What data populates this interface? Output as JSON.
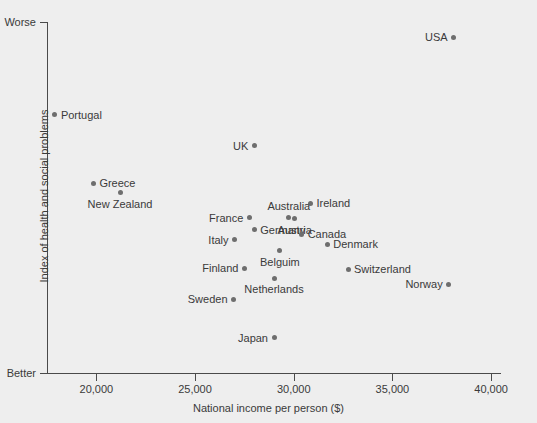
{
  "chart_data": {
    "type": "scatter",
    "title": "",
    "xlabel": "National income per person ($)",
    "ylabel": "Index of health and social problems",
    "xlim": [
      17500,
      40500
    ],
    "ylim": [
      0,
      100
    ],
    "grid": false,
    "legend": "none",
    "y_axis_endpoints": {
      "top": "Worse",
      "bottom": "Better"
    },
    "x_ticks": [
      {
        "label": "20,000",
        "value": 20000
      },
      {
        "label": "25,000",
        "value": 25000
      },
      {
        "label": "30,000",
        "value": 30000
      },
      {
        "label": "35,000",
        "value": 35000
      },
      {
        "label": "40,000",
        "value": 40000
      }
    ],
    "points": [
      {
        "name": "USA",
        "x": 38100,
        "y": 95.6,
        "label_pos": "left"
      },
      {
        "name": "Portugal",
        "x": 17900,
        "y": 73.6,
        "label_pos": "right"
      },
      {
        "name": "UK",
        "x": 28000,
        "y": 64.8,
        "label_pos": "left"
      },
      {
        "name": "Greece",
        "x": 19850,
        "y": 54.1,
        "label_pos": "right"
      },
      {
        "name": "New Zealand",
        "x": 21200,
        "y": 51.3,
        "label_pos": "below"
      },
      {
        "name": "Ireland",
        "x": 30850,
        "y": 48.4,
        "label_pos": "right"
      },
      {
        "name": "Australia",
        "x": 29750,
        "y": 44.2,
        "label_pos": "above"
      },
      {
        "name": "France",
        "x": 27750,
        "y": 44.2,
        "label_pos": "left"
      },
      {
        "name": "Austria",
        "x": 30050,
        "y": 43.9,
        "label_pos": "below"
      },
      {
        "name": "Germany",
        "x": 28000,
        "y": 40.8,
        "label_pos": "right"
      },
      {
        "name": "Italy",
        "x": 27000,
        "y": 38.0,
        "label_pos": "left"
      },
      {
        "name": "Canada",
        "x": 30400,
        "y": 39.6,
        "label_pos": "right"
      },
      {
        "name": "Denmark",
        "x": 31700,
        "y": 36.7,
        "label_pos": "right"
      },
      {
        "name": "Belguim",
        "x": 29300,
        "y": 34.9,
        "label_pos": "below"
      },
      {
        "name": "Finland",
        "x": 27500,
        "y": 29.9,
        "label_pos": "left"
      },
      {
        "name": "Switzerland",
        "x": 32750,
        "y": 29.6,
        "label_pos": "right"
      },
      {
        "name": "Netherlands",
        "x": 29000,
        "y": 27.0,
        "label_pos": "below"
      },
      {
        "name": "Norway",
        "x": 37850,
        "y": 25.3,
        "label_pos": "left"
      },
      {
        "name": "Sweden",
        "x": 26950,
        "y": 21.0,
        "label_pos": "left"
      },
      {
        "name": "Japan",
        "x": 29000,
        "y": 10.1,
        "label_pos": "left"
      }
    ]
  }
}
